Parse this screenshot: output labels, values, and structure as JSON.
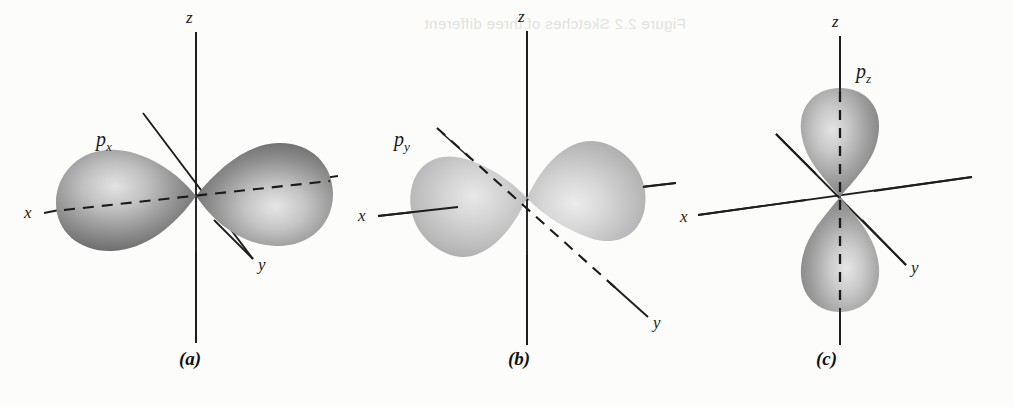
{
  "figure": {
    "type": "orbital-diagram",
    "background_color": "#fcfcfb",
    "ghost_text": "Figure 2.2   Sketches of three different",
    "axis_color": "#1e1e1e",
    "lobe_dark": "#6f6f6f",
    "lobe_light": "#d6d6d6"
  },
  "panels": [
    {
      "id": "a",
      "caption": "(a)",
      "orbital_label": "p",
      "orbital_subscript": "x",
      "axes": [
        {
          "name": "z",
          "label": "z"
        },
        {
          "name": "x",
          "label": "x"
        },
        {
          "name": "y",
          "label": "y"
        }
      ],
      "lobe_axis": "x",
      "lobe_count": 2,
      "orientation": "horizontal-left-right"
    },
    {
      "id": "b",
      "caption": "(b)",
      "orbital_label": "p",
      "orbital_subscript": "y",
      "axes": [
        {
          "name": "z",
          "label": "z"
        },
        {
          "name": "x",
          "label": "x"
        },
        {
          "name": "y",
          "label": "y"
        }
      ],
      "lobe_axis": "y",
      "lobe_count": 2,
      "orientation": "diagonal-upper-left-lower-right"
    },
    {
      "id": "c",
      "caption": "(c)",
      "orbital_label": "p",
      "orbital_subscript": "z",
      "axes": [
        {
          "name": "z",
          "label": "z"
        },
        {
          "name": "x",
          "label": "x"
        },
        {
          "name": "y",
          "label": "y"
        }
      ],
      "lobe_axis": "z",
      "lobe_count": 2,
      "orientation": "vertical-up-down"
    }
  ]
}
